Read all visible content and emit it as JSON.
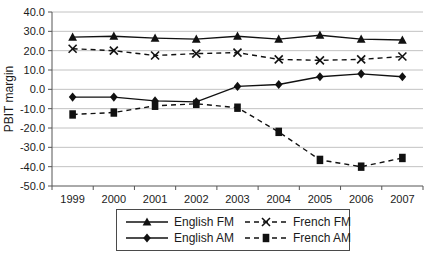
{
  "chart_data": {
    "type": "line",
    "title": "",
    "xlabel": "",
    "ylabel": "PBIT margin",
    "ylim": [
      -50,
      40
    ],
    "ytick_step": 10,
    "ytick_labels": [
      "40.0",
      "30.0",
      "20.0",
      "10.0",
      "0.0",
      "-10.0",
      "-20.0",
      "-30.0",
      "-40.0",
      "-50.0"
    ],
    "categories": [
      "1999",
      "2000",
      "2001",
      "2002",
      "2003",
      "2004",
      "2005",
      "2006",
      "2007"
    ],
    "grid": true,
    "legend_position": "bottom",
    "series": [
      {
        "name": "English FM",
        "line": "solid",
        "marker": "triangle",
        "color": "#111111",
        "values": [
          27.0,
          27.5,
          26.5,
          26.0,
          27.5,
          26.0,
          28.0,
          26.0,
          25.5
        ]
      },
      {
        "name": "French FM",
        "line": "dashed",
        "marker": "x",
        "color": "#111111",
        "values": [
          21.0,
          20.0,
          17.5,
          18.5,
          19.0,
          15.5,
          15.0,
          15.5,
          17.0
        ]
      },
      {
        "name": "English AM",
        "line": "solid",
        "marker": "diamond",
        "color": "#111111",
        "values": [
          -4.0,
          -4.0,
          -6.0,
          -6.5,
          1.5,
          2.5,
          6.5,
          8.0,
          6.5
        ]
      },
      {
        "name": "French AM",
        "line": "dashed",
        "marker": "square",
        "color": "#111111",
        "values": [
          -13.0,
          -12.0,
          -8.5,
          -7.5,
          -9.5,
          -22.0,
          -36.5,
          -40.0,
          -35.5
        ]
      }
    ],
    "colors": {
      "grid": "#c2c2c2",
      "axis": "#555555",
      "text": "#1b1b1b",
      "background": "#ffffff"
    }
  }
}
